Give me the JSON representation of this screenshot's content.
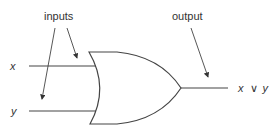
{
  "diagram": {
    "labels": {
      "inputs": "inputs",
      "output": "output",
      "input_x": "x",
      "input_y": "y",
      "result_x": "x",
      "result_op": "∨",
      "result_y": "y"
    },
    "colors": {
      "stroke": "#444444",
      "text": "#333333"
    }
  }
}
